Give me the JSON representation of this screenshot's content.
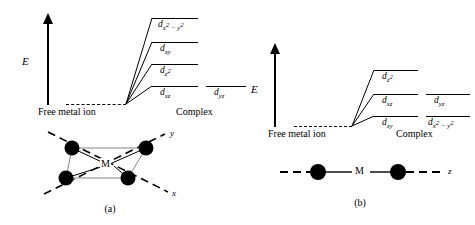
{
  "figure": {
    "type": "crystal-field-splitting-diagram",
    "energy_axis_label": "E",
    "free_ion_label": "Free metal ion",
    "complex_label": "Complex",
    "metal_symbol": "M"
  },
  "panels": [
    {
      "id": "a",
      "caption": "(a)",
      "geometry": "square planar",
      "axis_label": "E",
      "free_ion_label": "Free metal ion",
      "complex_label": "Complex",
      "metal_symbol": "M",
      "coordinate_axes": [
        "y",
        "x"
      ],
      "ligand_count": 4,
      "levels": [
        {
          "label_html": "d<sub>x<sup>2</sup> &minus; y<sup>2</sup></sub>",
          "label_text": "d x2 - y2",
          "rank": 1
        },
        {
          "label_html": "d<sub>xy</sub>",
          "label_text": "d xy",
          "rank": 2
        },
        {
          "label_html": "d<sub>z<sup>2</sup></sub>",
          "label_text": "d z2",
          "rank": 3
        },
        {
          "label_html": "d<sub>xz</sub>",
          "label_text": "d xz",
          "rank": 4
        },
        {
          "label_html": "d<sub>yz</sub>",
          "label_text": "d yz",
          "rank": 4
        }
      ]
    },
    {
      "id": "b",
      "caption": "(b)",
      "geometry": "linear",
      "axis_label": "E",
      "free_ion_label": "Free metal ion",
      "complex_label": "Complex",
      "metal_symbol": "M",
      "coordinate_axes": [
        "z"
      ],
      "ligand_count": 2,
      "levels": [
        {
          "label_html": "d<sub>z<sup>2</sup></sub>",
          "label_text": "d z2",
          "rank": 1
        },
        {
          "label_html": "d<sub>xz</sub>",
          "label_text": "d xz",
          "rank": 2
        },
        {
          "label_html": "d<sub>yz</sub>",
          "label_text": "d yz",
          "rank": 2
        },
        {
          "label_html": "d<sub>xy</sub>",
          "label_text": "d xy",
          "rank": 3
        },
        {
          "label_html": "d<sub>x<sup>2</sup> &minus; y<sup>2</sup></sub>",
          "label_text": "d x2 - y2",
          "rank": 3
        }
      ]
    }
  ]
}
